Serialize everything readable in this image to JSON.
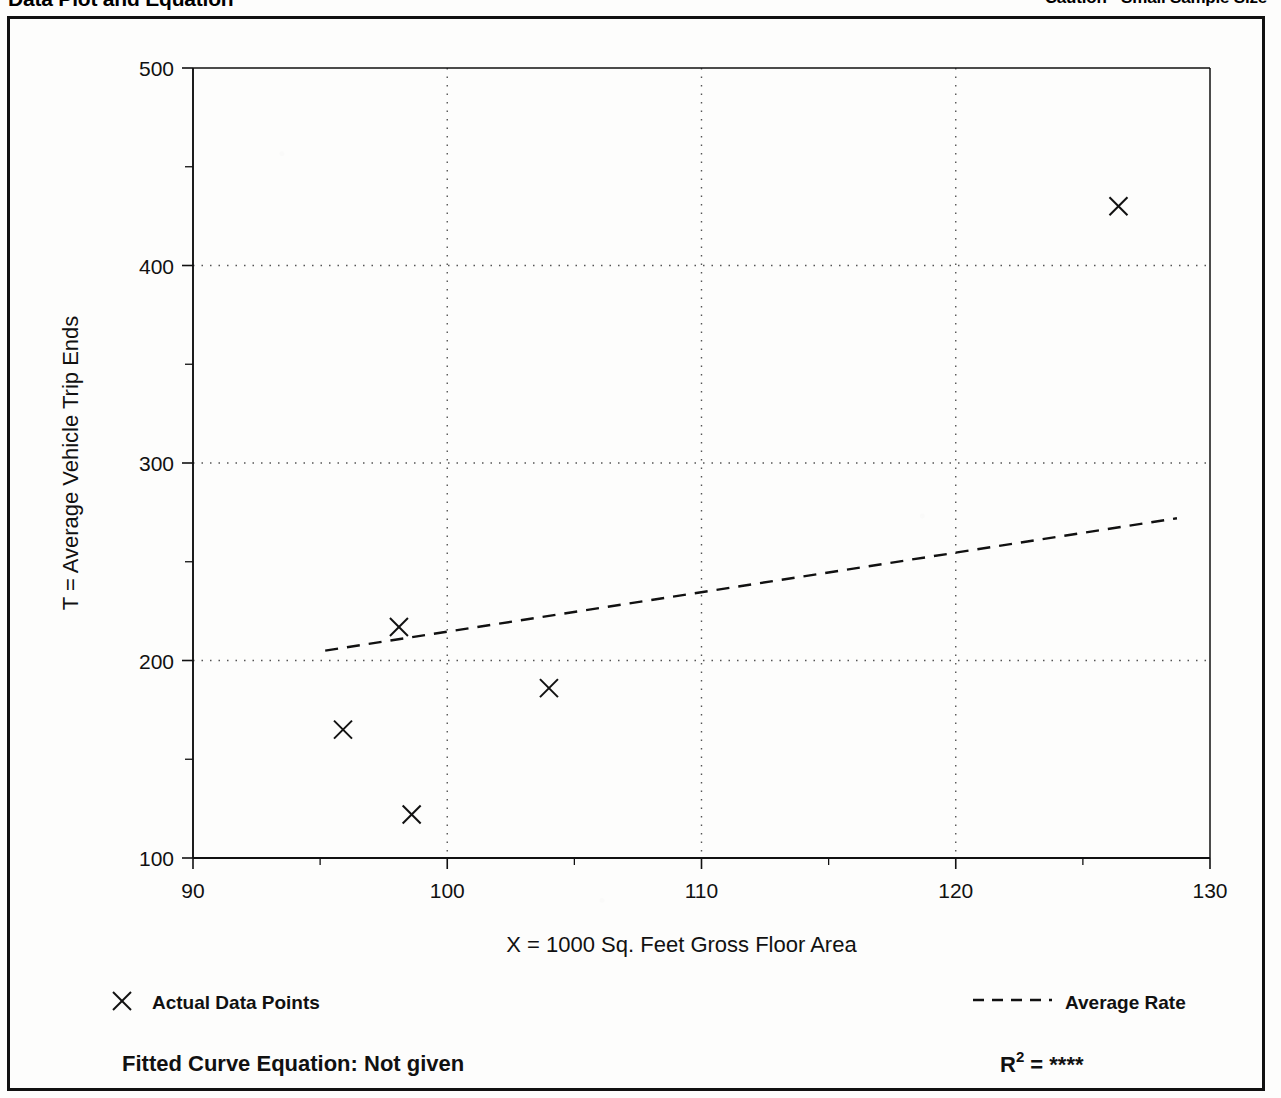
{
  "header": {
    "left_title": "Data Plot and Equation",
    "right_title": "Caution - Small Sample Size"
  },
  "chart_data": {
    "type": "scatter",
    "title": "",
    "xlabel": "X = 1000 Sq. Feet Gross Floor Area",
    "ylabel": "T = Average Vehicle Trip Ends",
    "xlim": [
      90,
      130
    ],
    "ylim": [
      100,
      500
    ],
    "x_ticks": [
      "90",
      "100",
      "110",
      "120",
      "130"
    ],
    "x_tick_values": [
      90,
      100,
      110,
      120,
      130
    ],
    "x_minor_values": [
      95,
      105,
      115,
      125
    ],
    "y_ticks": [
      "100",
      "200",
      "300",
      "400",
      "500"
    ],
    "y_tick_values": [
      100,
      200,
      300,
      400,
      500
    ],
    "y_minor_values": [
      150,
      250,
      350,
      450
    ],
    "grid": true,
    "grid_style": "dotted",
    "legend_position": "below-plot",
    "series": [
      {
        "name": "Actual Data Points",
        "type": "scatter",
        "marker": "x",
        "points": [
          {
            "x": 95.9,
            "y": 165
          },
          {
            "x": 98.1,
            "y": 217
          },
          {
            "x": 98.6,
            "y": 122
          },
          {
            "x": 104.0,
            "y": 186
          },
          {
            "x": 126.4,
            "y": 430
          }
        ]
      },
      {
        "name": "Average Rate",
        "type": "line",
        "style": "dashed",
        "points": [
          {
            "x": 95.2,
            "y": 205
          },
          {
            "x": 128.7,
            "y": 272
          }
        ]
      }
    ]
  },
  "legend": {
    "data_points_marker": "x-marker-icon",
    "data_points_label": "Actual Data Points",
    "average_rate_marker": "dashed-line-icon",
    "average_rate_label": "Average Rate"
  },
  "footer": {
    "equation_label": "Fitted Curve Equation:",
    "equation_value": "Not given",
    "r2_label": "R",
    "r2_exponent": "2",
    "r2_equals": "=",
    "r2_value": "****"
  },
  "colors": {
    "ink": "#111111",
    "grid": "#555555",
    "paper": "#fdfdfc"
  }
}
